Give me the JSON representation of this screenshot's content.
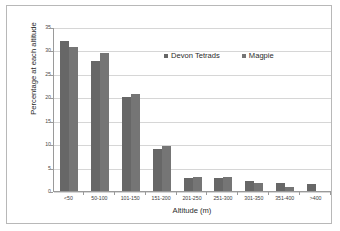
{
  "chart_data": {
    "type": "bar",
    "title": "",
    "xlabel": "Altitude (m)",
    "ylabel": "Percentage at each altitude",
    "categories": [
      "<50",
      "50-100",
      "101-150",
      "151-200",
      "201-250",
      "251-300",
      "301-350",
      "351-400",
      ">400"
    ],
    "series": [
      {
        "name": "Devon Tetrads",
        "color": "#676767",
        "values": [
          32.0,
          27.8,
          20.0,
          9.0,
          2.7,
          2.7,
          2.2,
          1.7,
          1.5
        ]
      },
      {
        "name": "Magpie",
        "color": "#757575",
        "values": [
          30.8,
          29.5,
          20.8,
          9.7,
          3.0,
          2.9,
          1.8,
          0.8,
          0.0
        ]
      }
    ],
    "ylim": [
      0,
      35
    ],
    "yticks": [
      0,
      5,
      10,
      15,
      20,
      25,
      30,
      35
    ],
    "ytick_labels": [
      "0",
      "5",
      "10",
      "15",
      "20",
      "25",
      "30",
      "35"
    ],
    "grid": "horizontal",
    "legend_position": "top-center-inside"
  }
}
